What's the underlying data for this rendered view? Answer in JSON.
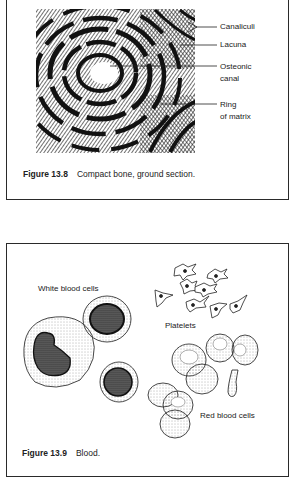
{
  "figures": [
    {
      "id": "13.8",
      "number_label": "Figure 13.8",
      "caption": "Compact bone, ground section.",
      "illustration": "compact-bone-osteon-hatched-drawing",
      "labels": {
        "canaliculi": "Canaliculi",
        "lacuna": "Lacuna",
        "osteonic_line1": "Osteonic",
        "osteonic_line2": "canal",
        "ring_line1": "Ring",
        "ring_line2": "of matrix"
      }
    },
    {
      "id": "13.9",
      "number_label": "Figure 13.9",
      "caption": "Blood.",
      "illustration": "blood-cells-drawing",
      "labels": {
        "white": "White blood cells",
        "platelets": "Platelets",
        "red": "Red blood cells"
      }
    }
  ]
}
